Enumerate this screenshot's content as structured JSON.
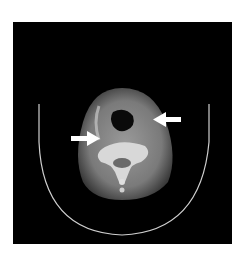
{
  "image": {
    "kind": "axial CT slice of neck",
    "background": "#ffffff",
    "frame_color": "#000000",
    "annotations": [
      {
        "type": "arrow",
        "direction": "left",
        "label": "arrow-right-side"
      },
      {
        "type": "arrow",
        "direction": "right",
        "label": "arrow-left-side"
      }
    ]
  }
}
